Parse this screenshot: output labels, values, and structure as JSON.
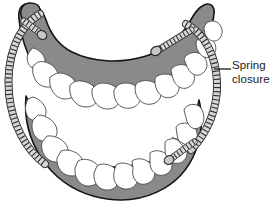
{
  "figure": {
    "kind": "dental-arch-diagram",
    "background_color": "#ffffff"
  },
  "annotation": {
    "label_line1": "Spring",
    "label_line2": "closure",
    "leader_line": "horizontal-dash",
    "text_color": "#1a1a1a"
  },
  "colors": {
    "gum": "#8a8a8a",
    "gum_outline": "#1a1a1a",
    "tooth_fill": "#ffffff",
    "tooth_outline": "#4a4a4a",
    "spring_fill": "#d6d6d6",
    "spring_outline": "#2b2b2b",
    "bead_fill": "#c8c8c8",
    "bead_outline": "#2b2b2b"
  },
  "parts": {
    "upper_arch": "maxillary-gum-arch",
    "lower_arch": "mandibular-gum-arch",
    "upper_teeth_count": 12,
    "lower_teeth_count": 12,
    "spring_left": "left-coil-spring",
    "spring_right": "right-coil-spring",
    "bead_upper_left": "attachment-bead",
    "bead_upper_right": "attachment-bead",
    "bead_lower_right": "attachment-bead"
  }
}
